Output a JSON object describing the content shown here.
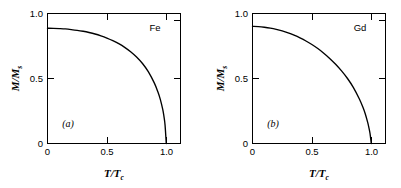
{
  "figure": {
    "background_color": "#ffffff",
    "line_color": "#000000"
  },
  "chart_data": [
    {
      "type": "line",
      "panel_label": "(a)",
      "series_name": "Fe",
      "title": "",
      "xlabel": "T/Tc",
      "xlabel_numerator": "T",
      "xlabel_denominator": "T",
      "xlabel_subscript": "c",
      "ylabel": "M/Ms",
      "ylabel_numerator": "M",
      "ylabel_denominator": "M",
      "ylabel_subscript": "s",
      "xlim": [
        0,
        1.12
      ],
      "ylim": [
        0,
        1.06
      ],
      "xticks": [
        0,
        0.5,
        1.0
      ],
      "xticklabels": [
        "0",
        "0.5",
        "1.0"
      ],
      "yticks": [
        0,
        0.5,
        1.0
      ],
      "yticklabels": [
        "0",
        "0.5",
        "1.0"
      ],
      "grid": false,
      "legend": false,
      "x": [
        0.0,
        0.05,
        0.1,
        0.15,
        0.2,
        0.25,
        0.3,
        0.35,
        0.4,
        0.45,
        0.5,
        0.55,
        0.6,
        0.65,
        0.7,
        0.75,
        0.8,
        0.85,
        0.9,
        0.93,
        0.95,
        0.97,
        0.98,
        0.99,
        1.0
      ],
      "y": [
        0.94,
        0.939,
        0.937,
        0.934,
        0.929,
        0.923,
        0.915,
        0.905,
        0.893,
        0.878,
        0.86,
        0.839,
        0.814,
        0.784,
        0.748,
        0.705,
        0.652,
        0.584,
        0.492,
        0.42,
        0.36,
        0.28,
        0.225,
        0.15,
        0.0
      ]
    },
    {
      "type": "line",
      "panel_label": "(b)",
      "series_name": "Gd",
      "title": "",
      "xlabel": "T/Tc",
      "xlabel_numerator": "T",
      "xlabel_denominator": "T",
      "xlabel_subscript": "c",
      "ylabel": "M/Ms",
      "ylabel_numerator": "M",
      "ylabel_denominator": "M",
      "ylabel_subscript": "s",
      "xlim": [
        0,
        1.12
      ],
      "ylim": [
        0,
        1.06
      ],
      "xticks": [
        0,
        0.5,
        1.0
      ],
      "xticklabels": [
        "0",
        "0.5",
        "1.0"
      ],
      "yticks": [
        0,
        0.5,
        1.0
      ],
      "yticklabels": [
        "0",
        "0.5",
        "1.0"
      ],
      "grid": false,
      "legend": false,
      "x": [
        0.0,
        0.05,
        0.1,
        0.15,
        0.2,
        0.25,
        0.3,
        0.35,
        0.4,
        0.45,
        0.5,
        0.55,
        0.6,
        0.65,
        0.7,
        0.75,
        0.8,
        0.85,
        0.9,
        0.93,
        0.95,
        0.97,
        0.98,
        0.99,
        1.0
      ],
      "y": [
        0.955,
        0.953,
        0.948,
        0.941,
        0.931,
        0.918,
        0.902,
        0.883,
        0.861,
        0.836,
        0.807,
        0.774,
        0.736,
        0.694,
        0.646,
        0.592,
        0.53,
        0.456,
        0.363,
        0.295,
        0.24,
        0.172,
        0.13,
        0.08,
        0.0
      ]
    }
  ],
  "panel_a": {
    "label": "(a)",
    "specimen": "Fe",
    "ticklabels_x": [
      "0",
      "0.5",
      "1.0"
    ],
    "ticklabels_y": [
      "0",
      "0.5",
      "1.0"
    ]
  },
  "panel_b": {
    "label": "(b)",
    "specimen": "Gd",
    "ticklabels_x": [
      "0",
      "0.5",
      "1.0"
    ],
    "ticklabels_y": [
      "0",
      "0.5",
      "1.0"
    ]
  }
}
